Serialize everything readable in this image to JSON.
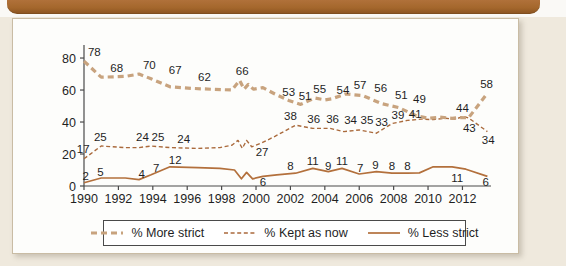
{
  "colors": {
    "banner": "#a4672c",
    "more_strict_line": "#c8a37e",
    "kept_as_now_line": "#aa6a3c",
    "less_strict_line": "#b3703c",
    "axis": "#4a4a4a"
  },
  "chart_data": {
    "type": "line",
    "title": "",
    "xlabel": "",
    "ylabel": "",
    "grid": false,
    "legend_position": "bottom",
    "xlim": [
      1990,
      2013.66
    ],
    "ylim": [
      0,
      86.9
    ],
    "x_ticks": [
      1990,
      1992,
      1994,
      1996,
      1998,
      2000,
      2002,
      2004,
      2006,
      2008,
      2010,
      2012
    ],
    "y_ticks": [
      0,
      20,
      40,
      60,
      80
    ],
    "series": [
      {
        "name": "% Less strict",
        "style": "solid",
        "color": "#b3703c",
        "points": [
          [
            1990,
            2
          ],
          [
            1991,
            5
          ],
          [
            1992.4,
            5
          ],
          [
            1993.2,
            4
          ],
          [
            1993.9,
            7
          ],
          [
            1995,
            12
          ],
          [
            1996.6,
            11.5
          ],
          [
            1997.9,
            11
          ],
          [
            1998.75,
            10
          ],
          [
            1999.15,
            4.5
          ],
          [
            1999.45,
            8.5
          ],
          [
            1999.8,
            4.5
          ],
          [
            2000.4,
            6
          ],
          [
            2001.2,
            7
          ],
          [
            2002.3,
            8
          ],
          [
            2003.3,
            11
          ],
          [
            2004.2,
            9
          ],
          [
            2005.0,
            11
          ],
          [
            2006.0,
            7.5
          ],
          [
            2007.0,
            9
          ],
          [
            2007.9,
            8
          ],
          [
            2008.8,
            8
          ],
          [
            2009.5,
            8.2
          ],
          [
            2010.3,
            12
          ],
          [
            2011.4,
            12
          ],
          [
            2012.2,
            10.5
          ],
          [
            2013.45,
            6
          ]
        ],
        "labels": [
          {
            "t": "2",
            "x": 1990.1,
            "v": 6
          },
          {
            "t": "5",
            "x": 1990.95,
            "v": 8.5
          },
          {
            "t": "4",
            "x": 1993.35,
            "v": 7.5
          },
          {
            "t": "7",
            "x": 1994.2,
            "v": 11
          },
          {
            "t": "12",
            "x": 1995.3,
            "v": 16.5
          },
          {
            "t": "6",
            "x": 2000.4,
            "v": 2.6
          },
          {
            "t": "8",
            "x": 2002.0,
            "v": 12.5
          },
          {
            "t": "11",
            "x": 2003.3,
            "v": 15.5
          },
          {
            "t": "9",
            "x": 2004.2,
            "v": 12.5
          },
          {
            "t": "11",
            "x": 2005.0,
            "v": 15.5
          },
          {
            "t": "7",
            "x": 2006.05,
            "v": 11.5
          },
          {
            "t": "9",
            "x": 2006.95,
            "v": 13
          },
          {
            "t": "8",
            "x": 2007.9,
            "v": 12.5
          },
          {
            "t": "8",
            "x": 2008.8,
            "v": 12.5
          },
          {
            "t": "11",
            "x": 2011.7,
            "v": 5
          },
          {
            "t": "6",
            "x": 2013.35,
            "v": 2.4
          }
        ]
      },
      {
        "name": "% Kept as now",
        "style": "dashed-thin",
        "color": "#aa6a3c",
        "points": [
          [
            1990,
            17
          ],
          [
            1991,
            25
          ],
          [
            1992.4,
            24
          ],
          [
            1993.2,
            24
          ],
          [
            1993.9,
            25
          ],
          [
            1995,
            24
          ],
          [
            1996.6,
            23.5
          ],
          [
            1997.9,
            24
          ],
          [
            1998.6,
            25.5
          ],
          [
            1998.95,
            28.5
          ],
          [
            1999.2,
            23.5
          ],
          [
            1999.45,
            28.5
          ],
          [
            1999.75,
            24.5
          ],
          [
            2000.35,
            27
          ],
          [
            2001.1,
            31
          ],
          [
            2002.3,
            38
          ],
          [
            2003.3,
            36
          ],
          [
            2004.3,
            36
          ],
          [
            2005.1,
            34
          ],
          [
            2006.0,
            35
          ],
          [
            2007.0,
            33
          ],
          [
            2007.9,
            39
          ],
          [
            2008.8,
            41
          ],
          [
            2009.6,
            41.8
          ],
          [
            2010.3,
            41.5
          ],
          [
            2011.0,
            42.3
          ],
          [
            2011.6,
            41.8
          ],
          [
            2012.05,
            43.5
          ],
          [
            2012.35,
            42.6
          ],
          [
            2013.45,
            34
          ]
        ],
        "labels": [
          {
            "t": "17",
            "x": 1989.95,
            "v": 23
          },
          {
            "t": "25",
            "x": 1990.95,
            "v": 30.5
          },
          {
            "t": "24",
            "x": 1993.4,
            "v": 30.5
          },
          {
            "t": "25",
            "x": 1994.3,
            "v": 30.5
          },
          {
            "t": "24",
            "x": 1995.8,
            "v": 29.5
          },
          {
            "t": "27",
            "x": 2000.35,
            "v": 21
          },
          {
            "t": "38",
            "x": 2002.0,
            "v": 44
          },
          {
            "t": "36",
            "x": 2003.35,
            "v": 42
          },
          {
            "t": "36",
            "x": 2004.45,
            "v": 42
          },
          {
            "t": "34",
            "x": 2005.5,
            "v": 41
          },
          {
            "t": "35",
            "x": 2006.45,
            "v": 41
          },
          {
            "t": "33",
            "x": 2007.3,
            "v": 40
          },
          {
            "t": "39",
            "x": 2008.25,
            "v": 44.5
          },
          {
            "t": "41",
            "x": 2009.25,
            "v": 45
          },
          {
            "t": "44",
            "x": 2012.0,
            "v": 49
          },
          {
            "t": "34",
            "x": 2013.5,
            "v": 28.5
          }
        ]
      },
      {
        "name": "% More strict",
        "style": "dashed-thick",
        "color": "#c8a37e",
        "points": [
          [
            1990,
            78
          ],
          [
            1991,
            68
          ],
          [
            1992.4,
            68.5
          ],
          [
            1993.2,
            70
          ],
          [
            1993.9,
            67
          ],
          [
            1995,
            62
          ],
          [
            1996.3,
            61
          ],
          [
            1997.6,
            60.4
          ],
          [
            1998.6,
            60
          ],
          [
            1999.05,
            66
          ],
          [
            1999.3,
            60.5
          ],
          [
            1999.55,
            63.5
          ],
          [
            1999.85,
            60.5
          ],
          [
            2000.4,
            61.5
          ],
          [
            2001.1,
            57.5
          ],
          [
            2001.9,
            53.5
          ],
          [
            2002.6,
            51
          ],
          [
            2003.4,
            55
          ],
          [
            2004.0,
            53.8
          ],
          [
            2004.4,
            54.5
          ],
          [
            2005.2,
            57.5
          ],
          [
            2006.2,
            56.5
          ],
          [
            2007.3,
            51.5
          ],
          [
            2008.3,
            49
          ],
          [
            2009.3,
            44
          ],
          [
            2010.0,
            42.3
          ],
          [
            2010.7,
            43
          ],
          [
            2011.4,
            42.3
          ],
          [
            2011.9,
            42.8
          ],
          [
            2012.35,
            42.6
          ],
          [
            2013.45,
            58
          ]
        ],
        "labels": [
          {
            "t": "78",
            "x": 1990.6,
            "v": 83.5
          },
          {
            "t": "68",
            "x": 1991.9,
            "v": 73.5
          },
          {
            "t": "70",
            "x": 1993.8,
            "v": 75.5
          },
          {
            "t": "67",
            "x": 1995.3,
            "v": 72.5
          },
          {
            "t": "62",
            "x": 1997.0,
            "v": 68
          },
          {
            "t": "66",
            "x": 1999.2,
            "v": 72
          },
          {
            "t": "53",
            "x": 2001.9,
            "v": 59
          },
          {
            "t": "51",
            "x": 2002.85,
            "v": 56.5
          },
          {
            "t": "55",
            "x": 2003.7,
            "v": 60.5
          },
          {
            "t": "54",
            "x": 2005.05,
            "v": 60
          },
          {
            "t": "57",
            "x": 2006.05,
            "v": 63
          },
          {
            "t": "56",
            "x": 2007.25,
            "v": 61.5
          },
          {
            "t": "51",
            "x": 2008.45,
            "v": 57
          },
          {
            "t": "49",
            "x": 2009.5,
            "v": 54.5
          },
          {
            "t": "43",
            "x": 2012.4,
            "v": 36
          },
          {
            "t": "58",
            "x": 2013.4,
            "v": 63.5
          }
        ]
      }
    ]
  }
}
